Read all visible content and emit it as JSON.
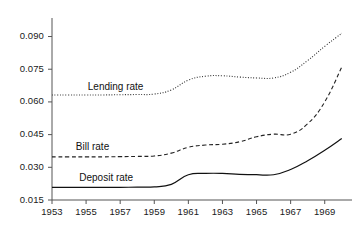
{
  "chart_data": {
    "type": "line",
    "title": "",
    "xlabel": "",
    "ylabel": "",
    "xlim": [
      1953,
      1970.6
    ],
    "ylim": [
      0.015,
      0.0985
    ],
    "grid": false,
    "legend_position": "inline-annotations",
    "xticks": [
      "1953",
      "1955",
      "1957",
      "1959",
      "1961",
      "1963",
      "1965",
      "1967",
      "1969"
    ],
    "xtick_values": [
      1953,
      1955,
      1957,
      1959,
      1961,
      1963,
      1965,
      1967,
      1969
    ],
    "yticks": [
      "0.015",
      "0.030",
      "0.045",
      "0.060",
      "0.075",
      "0.090"
    ],
    "ytick_values": [
      0.015,
      0.03,
      0.045,
      0.06,
      0.075,
      0.09
    ],
    "x": [
      1953,
      1954,
      1955,
      1956,
      1957,
      1958,
      1959,
      1960,
      1961,
      1962,
      1963,
      1964,
      1965,
      1966,
      1967,
      1968,
      1969,
      1970
    ],
    "series": [
      {
        "name": "Lending rate",
        "dash": "dotted",
        "color": "#333333",
        "label_x": 1955.1,
        "label_y": 0.0665,
        "values": [
          0.0632,
          0.0632,
          0.0632,
          0.0632,
          0.0633,
          0.0634,
          0.0636,
          0.0655,
          0.07,
          0.0718,
          0.072,
          0.0714,
          0.071,
          0.071,
          0.0736,
          0.079,
          0.0855,
          0.0915
        ]
      },
      {
        "name": "Bill rate",
        "dash": "dashed",
        "color": "#222222",
        "label_x": 1954.4,
        "label_y": 0.039,
        "values": [
          0.0348,
          0.0348,
          0.0348,
          0.0348,
          0.0349,
          0.035,
          0.0352,
          0.0365,
          0.0392,
          0.0402,
          0.0406,
          0.0417,
          0.044,
          0.0452,
          0.0452,
          0.05,
          0.06,
          0.076
        ]
      },
      {
        "name": "Deposit rate",
        "dash": "solid",
        "color": "#111111",
        "label_x": 1954.6,
        "label_y": 0.0245,
        "values": [
          0.0208,
          0.0208,
          0.0208,
          0.0208,
          0.0208,
          0.0209,
          0.021,
          0.0222,
          0.0266,
          0.0272,
          0.0272,
          0.0268,
          0.0266,
          0.0266,
          0.029,
          0.033,
          0.0378,
          0.0432
        ]
      }
    ]
  },
  "axis": {
    "axis_color": "#555555",
    "tick_color": "#555555"
  }
}
